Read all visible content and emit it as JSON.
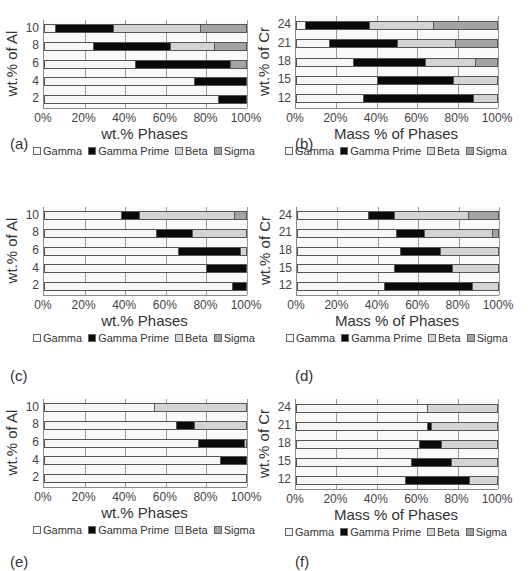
{
  "colors": {
    "Gamma": "#f7f7f7",
    "Gamma Prime": "#0a0a0a",
    "Beta": "#d4d4d4",
    "Sigma": "#a3a3a3"
  },
  "legend": [
    "Gamma",
    "Gamma Prime",
    "Beta",
    "Sigma"
  ],
  "chart_data": [
    {
      "id": "a",
      "panel_label": "(a)",
      "type": "bar",
      "orientation": "horizontal",
      "stacked": true,
      "xlabel": "wt.% Phases",
      "ylabel": "wt.% of Al",
      "categories": [
        "2",
        "4",
        "6",
        "8",
        "10"
      ],
      "xticks": [
        "0%",
        "20%",
        "40%",
        "60%",
        "80%",
        "100%"
      ],
      "xlim": [
        0,
        100
      ],
      "grid": true,
      "legend_position": "bottom",
      "series": [
        {
          "name": "Gamma",
          "values": [
            86,
            74,
            45,
            24,
            5
          ]
        },
        {
          "name": "Gamma Prime",
          "values": [
            14,
            26,
            47,
            38,
            29
          ]
        },
        {
          "name": "Beta",
          "values": [
            0,
            0,
            0,
            22,
            43
          ]
        },
        {
          "name": "Sigma",
          "values": [
            0,
            0,
            8,
            16,
            23
          ]
        }
      ]
    },
    {
      "id": "b",
      "panel_label": "(b)",
      "type": "bar",
      "orientation": "horizontal",
      "stacked": true,
      "xlabel": "Mass % of Phases",
      "ylabel": "wt.% of Cr",
      "categories": [
        "12",
        "15",
        "18",
        "21",
        "24"
      ],
      "xticks": [
        "0%",
        "20%",
        "40%",
        "60%",
        "80%",
        "100%"
      ],
      "xlim": [
        0,
        100
      ],
      "grid": true,
      "legend_position": "bottom",
      "series": [
        {
          "name": "Gamma",
          "values": [
            33,
            40,
            28,
            16,
            4
          ]
        },
        {
          "name": "Gamma Prime",
          "values": [
            55,
            38,
            36,
            34,
            32
          ]
        },
        {
          "name": "Beta",
          "values": [
            12,
            22,
            25,
            29,
            32
          ]
        },
        {
          "name": "Sigma",
          "values": [
            0,
            0,
            11,
            21,
            32
          ]
        }
      ]
    },
    {
      "id": "c",
      "panel_label": "(c)",
      "type": "bar",
      "orientation": "horizontal",
      "stacked": true,
      "xlabel": "wt.% Phases",
      "ylabel": "wt.% of Al",
      "categories": [
        "2",
        "4",
        "6",
        "8",
        "10"
      ],
      "xticks": [
        "0%",
        "20%",
        "40%",
        "60%",
        "80%",
        "100%"
      ],
      "xlim": [
        0,
        100
      ],
      "grid": true,
      "legend_position": "bottom",
      "series": [
        {
          "name": "Gamma",
          "values": [
            93,
            80,
            66,
            55,
            38
          ]
        },
        {
          "name": "Gamma Prime",
          "values": [
            7,
            20,
            31,
            18,
            9
          ]
        },
        {
          "name": "Beta",
          "values": [
            0,
            0,
            3,
            27,
            47
          ]
        },
        {
          "name": "Sigma",
          "values": [
            0,
            0,
            0,
            0,
            6
          ]
        }
      ]
    },
    {
      "id": "d",
      "panel_label": "(d)",
      "type": "bar",
      "orientation": "horizontal",
      "stacked": true,
      "xlabel": "Mass % of Phases",
      "ylabel": "wt.% of Cr",
      "categories": [
        "12",
        "15",
        "18",
        "21",
        "24"
      ],
      "xticks": [
        "0%",
        "20%",
        "40%",
        "60%",
        "80%",
        "100%"
      ],
      "xlim": [
        0,
        100
      ],
      "grid": true,
      "legend_position": "bottom",
      "series": [
        {
          "name": "Gamma",
          "values": [
            43,
            48,
            51,
            49,
            35
          ]
        },
        {
          "name": "Gamma Prime",
          "values": [
            44,
            29,
            20,
            14,
            13
          ]
        },
        {
          "name": "Beta",
          "values": [
            13,
            23,
            29,
            34,
            37
          ]
        },
        {
          "name": "Sigma",
          "values": [
            0,
            0,
            0,
            3,
            15
          ]
        }
      ]
    },
    {
      "id": "e",
      "panel_label": "(e)",
      "type": "bar",
      "orientation": "horizontal",
      "stacked": true,
      "xlabel": "wt.% Phases",
      "ylabel": "wt.% of Al",
      "categories": [
        "2",
        "4",
        "6",
        "8",
        "10"
      ],
      "xticks": [
        "0%",
        "20%",
        "40%",
        "60%",
        "80%",
        "100%"
      ],
      "xlim": [
        0,
        100
      ],
      "grid": true,
      "legend_position": "bottom",
      "series": [
        {
          "name": "Gamma",
          "values": [
            100,
            87,
            76,
            65,
            54
          ]
        },
        {
          "name": "Gamma Prime",
          "values": [
            0,
            13,
            23,
            9,
            0
          ]
        },
        {
          "name": "Beta",
          "values": [
            0,
            0,
            1,
            26,
            46
          ]
        },
        {
          "name": "Sigma",
          "values": [
            0,
            0,
            0,
            0,
            0
          ]
        }
      ]
    },
    {
      "id": "f",
      "panel_label": "(f)",
      "type": "bar",
      "orientation": "horizontal",
      "stacked": true,
      "xlabel": "Mass % of Phases",
      "ylabel": "wt.% of Cr",
      "categories": [
        "12",
        "15",
        "18",
        "21",
        "24"
      ],
      "xticks": [
        "0%",
        "20%",
        "40%",
        "60%",
        "80%",
        "100%"
      ],
      "xlim": [
        0,
        100
      ],
      "grid": true,
      "legend_position": "bottom",
      "series": [
        {
          "name": "Gamma",
          "values": [
            54,
            57,
            61,
            65,
            65
          ]
        },
        {
          "name": "Gamma Prime",
          "values": [
            32,
            20,
            11,
            2,
            0
          ]
        },
        {
          "name": "Beta",
          "values": [
            14,
            23,
            28,
            33,
            35
          ]
        },
        {
          "name": "Sigma",
          "values": [
            0,
            0,
            0,
            0,
            0
          ]
        }
      ]
    }
  ]
}
